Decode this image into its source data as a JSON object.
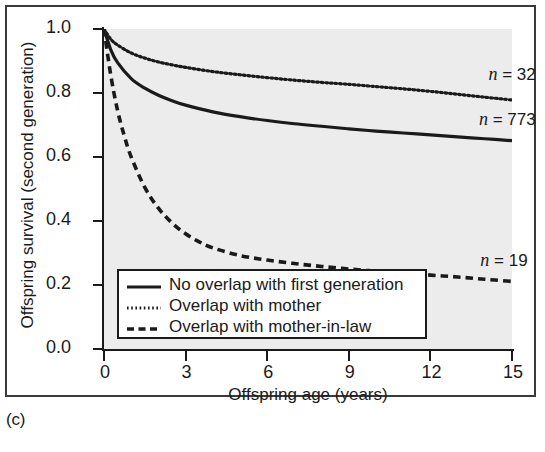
{
  "panel": {
    "label": "(c)"
  },
  "chart_data": {
    "type": "line",
    "title": "",
    "xlabel": "Offspring age (years)",
    "ylabel": "Offspring survival (second generation)",
    "xlim": [
      0,
      15
    ],
    "ylim": [
      0.0,
      1.0
    ],
    "xticks": [
      "0",
      "3",
      "6",
      "9",
      "12",
      "15"
    ],
    "xtick_values": [
      0,
      3,
      6,
      9,
      12,
      15
    ],
    "yticks": [
      "0.0",
      "0.2",
      "0.4",
      "0.6",
      "0.8",
      "1.0"
    ],
    "ytick_values": [
      0.0,
      0.2,
      0.4,
      0.6,
      0.8,
      1.0
    ],
    "grid": false,
    "plot_background": "#ececec",
    "legend_position": "lower-left-inside",
    "series": [
      {
        "name": "No overlap with first generation",
        "style": "solid",
        "color": "#1a1a1a",
        "n_label": "n = 773",
        "n_value": 773,
        "x": [
          0,
          0.25,
          0.5,
          1,
          1.5,
          2,
          2.5,
          3,
          4,
          5,
          6,
          7,
          8,
          9,
          10,
          11,
          12,
          13,
          14,
          15
        ],
        "y": [
          1.0,
          0.935,
          0.895,
          0.845,
          0.815,
          0.793,
          0.776,
          0.762,
          0.741,
          0.726,
          0.714,
          0.704,
          0.696,
          0.688,
          0.681,
          0.675,
          0.669,
          0.663,
          0.657,
          0.651
        ]
      },
      {
        "name": "Overlap with mother",
        "style": "dotted",
        "color": "#1a1a1a",
        "n_label": "n = 32",
        "n_value": 32,
        "x": [
          0,
          0.25,
          0.5,
          1,
          1.5,
          2,
          2.5,
          3,
          4,
          5,
          6,
          7,
          8,
          9,
          10,
          11,
          12,
          13,
          14,
          15
        ],
        "y": [
          1.0,
          0.968,
          0.95,
          0.925,
          0.909,
          0.897,
          0.888,
          0.88,
          0.867,
          0.857,
          0.848,
          0.84,
          0.833,
          0.827,
          0.82,
          0.813,
          0.805,
          0.796,
          0.787,
          0.778
        ]
      },
      {
        "name": "Overlap with mother-in-law",
        "style": "dashed",
        "color": "#1a1a1a",
        "n_label": "n = 19",
        "n_value": 19,
        "x": [
          0,
          0.25,
          0.5,
          0.75,
          1,
          1.5,
          2,
          2.5,
          3,
          3.5,
          4,
          5,
          6,
          7,
          8,
          9,
          10,
          11,
          12,
          13,
          14,
          15
        ],
        "y": [
          1.0,
          0.855,
          0.745,
          0.665,
          0.6,
          0.505,
          0.44,
          0.394,
          0.36,
          0.335,
          0.316,
          0.292,
          0.278,
          0.267,
          0.258,
          0.25,
          0.243,
          0.237,
          0.231,
          0.225,
          0.218,
          0.211
        ]
      }
    ],
    "annotations": [
      {
        "text": "n = 32",
        "x": 13.3,
        "y": 0.855
      },
      {
        "text": "n = 773",
        "x": 13.3,
        "y": 0.715
      },
      {
        "text": "n = 19",
        "x": 13.0,
        "y": 0.275
      }
    ]
  },
  "legend": {
    "items": [
      {
        "label": "No overlap with first generation",
        "style": "solid"
      },
      {
        "label": "Overlap with mother",
        "style": "dotted"
      },
      {
        "label": "Overlap with mother-in-law",
        "style": "dashed"
      }
    ]
  }
}
